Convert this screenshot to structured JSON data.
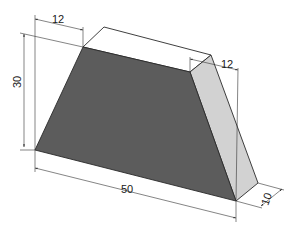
{
  "colors": {
    "front_face": "#5c5c5c",
    "side_face": "#d2d2d2",
    "top_face": "#ffffff",
    "outline": "#2a2a2a",
    "dimension_line": "#333333",
    "background": "#ffffff"
  },
  "dimensions": {
    "top_offset": {
      "label": "12",
      "description": "horizontal offset of top-left edge"
    },
    "height": {
      "label": "30",
      "description": "overall height"
    },
    "top_right_offset": {
      "label": "12",
      "description": "horizontal offset of top-right edge"
    },
    "base_length": {
      "label": "50",
      "description": "bottom length"
    },
    "depth": {
      "label": "10",
      "description": "thickness / depth"
    }
  }
}
